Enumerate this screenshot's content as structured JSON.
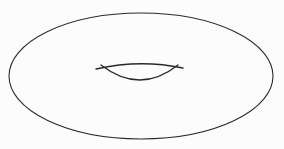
{
  "figure": {
    "name": "torus-line-drawing",
    "description": "Line drawing of a torus: a large flat ellipse with a lens-shaped inner hole",
    "background_color": "#fcfcfc",
    "stroke_color": "#2a2a2a",
    "stroke_width": 1.1,
    "canvas": {
      "width": 284,
      "height": 149
    },
    "outer_ellipse": {
      "name": "torus-outer-outline",
      "center_x": 141,
      "center_y": 76,
      "radius_x": 132,
      "radius_y": 63
    },
    "hole": {
      "name": "torus-hole-lens",
      "center_x": 139,
      "center_y": 74,
      "left_x": 96,
      "right_x": 183,
      "top_y": 66,
      "bottom_y": 83,
      "upper_arc": {
        "name": "hole-upper-arc",
        "start_x": 96,
        "start_y": 69,
        "end_x": 183,
        "end_y": 68,
        "control_x": 140,
        "control_y": 59
      },
      "lower_arc": {
        "name": "hole-lower-arc",
        "start_x": 101,
        "start_y": 65,
        "end_x": 178,
        "end_y": 65,
        "control_x": 140,
        "control_y": 95
      }
    }
  }
}
